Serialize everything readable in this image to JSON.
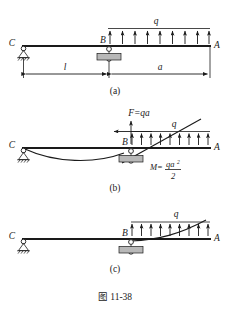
{
  "figure": {
    "caption": "图 11-38",
    "background_color": "#ffffff",
    "ink_color": "#1a1a1a",
    "hatch_block_color": "#b8b8b8"
  },
  "panels": [
    {
      "key": "a",
      "label": "(a)",
      "node_labels": {
        "left_support": "C",
        "mid_support": "B",
        "right_end": "A"
      },
      "load_label": "q",
      "load_arrow_count": 9,
      "load_direction": "up",
      "dimensions": [
        {
          "name": "left-span",
          "label": "l"
        },
        {
          "name": "right-span",
          "label": "a"
        }
      ]
    },
    {
      "key": "b",
      "label": "(b)",
      "node_labels": {
        "left_support": "C",
        "mid_support": "B",
        "right_end": "A"
      },
      "load_label": "q",
      "load_arrow_count": 9,
      "load_direction": "up",
      "force_label": "F=qa",
      "moment_label_prefix": "M=",
      "moment_numerator": "qa",
      "moment_numerator_exponent": "2",
      "moment_denominator": "2",
      "has_deflection_curve": true,
      "has_tangent_line": true,
      "has_left_arrow": true
    },
    {
      "key": "c",
      "label": "(c)",
      "node_labels": {
        "left_support": "C",
        "mid_support": "B",
        "right_end": "A"
      },
      "load_label": "q",
      "load_arrow_count": 9,
      "load_direction": "up",
      "has_deflection_curve": true
    }
  ]
}
